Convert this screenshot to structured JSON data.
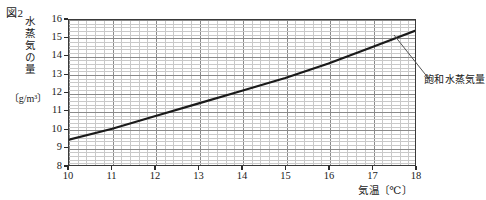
{
  "figure": {
    "number_label": "図2"
  },
  "axes": {
    "y_title_main": "水蒸気の量",
    "y_title_unit": "〔g/m³〕",
    "x_title": "気温〔℃〕",
    "y_ticks": [
      "8",
      "9",
      "10",
      "11",
      "12",
      "13",
      "14",
      "15",
      "16"
    ],
    "x_ticks": [
      "10",
      "11",
      "12",
      "13",
      "14",
      "15",
      "16",
      "17",
      "18"
    ]
  },
  "annotation": {
    "curve_label": "飽和水蒸気量"
  },
  "chart_data": {
    "type": "line",
    "title": "図2",
    "xlabel": "気温〔℃〕",
    "ylabel": "水蒸気の量〔g/m³〕",
    "xlim": [
      10,
      18
    ],
    "ylim": [
      8,
      16
    ],
    "xticks": [
      10,
      11,
      12,
      13,
      14,
      15,
      16,
      17,
      18
    ],
    "yticks": [
      8,
      9,
      10,
      11,
      12,
      13,
      14,
      15,
      16
    ],
    "grid": true,
    "minor_grid": true,
    "x_minor_per_major": 5,
    "y_minor_per_major": 5,
    "legend": "none",
    "annotations": [
      {
        "text": "飽和水蒸気量",
        "points_to_x": 17.2,
        "points_to_y": 14.8
      }
    ],
    "series": [
      {
        "name": "飽和水蒸気量",
        "color": "#1a1a1a",
        "x": [
          10,
          11,
          12,
          13,
          14,
          15,
          16,
          17,
          18
        ],
        "values": [
          9.4,
          10.0,
          10.7,
          11.4,
          12.1,
          12.8,
          13.6,
          14.5,
          15.4
        ]
      }
    ]
  }
}
